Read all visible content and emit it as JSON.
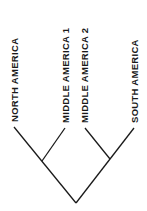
{
  "diagram": {
    "type": "cladogram",
    "line_color": "#1a1a1a",
    "leaves": [
      {
        "label": "NORTH AMERICA",
        "x": 14,
        "y": 127
      },
      {
        "label": "MIDDLE AMERICA 1",
        "x": 65,
        "y": 128
      },
      {
        "label": "MIDDLE AMERICA 2",
        "x": 85,
        "y": 128
      },
      {
        "label": "SOUTH AMERICA",
        "x": 134,
        "y": 128
      }
    ],
    "internal_nodes": [
      {
        "id": "left_clade",
        "x": 42,
        "y": 160,
        "children": [
          "NORTH AMERICA",
          "MIDDLE AMERICA 1"
        ]
      },
      {
        "id": "right_clade",
        "x": 110,
        "y": 159,
        "children": [
          "MIDDLE AMERICA 2",
          "SOUTH AMERICA"
        ]
      }
    ],
    "root": {
      "x": 76,
      "y": 203,
      "children": [
        "left_clade",
        "right_clade"
      ]
    }
  }
}
